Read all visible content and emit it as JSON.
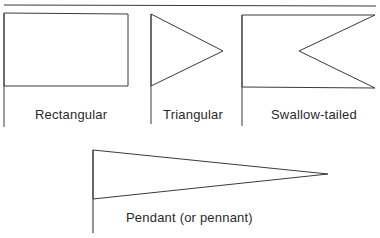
{
  "diagram": {
    "top_rule": {
      "x1": 4,
      "y1": 5,
      "x2": 376,
      "y2": 6
    },
    "stroke_color": "#3a3a3a",
    "flags": [
      {
        "id": "rectangular",
        "label": "Rectangular",
        "pole": {
          "x": 4,
          "top": 13,
          "bottom": 127
        },
        "shape": [
          [
            4,
            13
          ],
          [
            128,
            14
          ],
          [
            128,
            86
          ],
          [
            4,
            86
          ]
        ],
        "label_pos": {
          "x": 35,
          "y": 119
        }
      },
      {
        "id": "triangular",
        "label": "Triangular",
        "pole": {
          "x": 151,
          "top": 14,
          "bottom": 124
        },
        "shape": [
          [
            151,
            14
          ],
          [
            223,
            51
          ],
          [
            151,
            86
          ]
        ],
        "label_pos": {
          "x": 163,
          "y": 119
        }
      },
      {
        "id": "swallow-tailed",
        "label": "Swallow-tailed",
        "pole": {
          "x": 242,
          "top": 15,
          "bottom": 126
        },
        "shape": [
          [
            242,
            15
          ],
          [
            375,
            15
          ],
          [
            299,
            51
          ],
          [
            375,
            88
          ],
          [
            242,
            87
          ]
        ],
        "label_pos": {
          "x": 271,
          "y": 119
        }
      },
      {
        "id": "pendant",
        "label": "Pendant (or pennant)",
        "pole": {
          "x": 93,
          "top": 150,
          "bottom": 233
        },
        "shape": [
          [
            93,
            150
          ],
          [
            328,
            174
          ],
          [
            93,
            199
          ]
        ],
        "label_pos": {
          "x": 126,
          "y": 222
        }
      }
    ]
  }
}
